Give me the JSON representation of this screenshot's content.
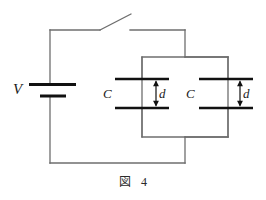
{
  "figure": {
    "caption_label": "図",
    "caption_number": "4",
    "kind": "circuit-diagram"
  },
  "circuit": {
    "source": {
      "name": "battery",
      "label": "V",
      "symbol": "battery-cell"
    },
    "switch": {
      "name": "switch",
      "state": "open",
      "label": ""
    },
    "capacitors": [
      {
        "name": "capacitor-1",
        "label": "C",
        "gap_label": "d",
        "gap_arrow": "double-headed-vertical"
      },
      {
        "name": "capacitor-2",
        "label": "C",
        "gap_label": "d",
        "gap_arrow": "double-headed-vertical"
      }
    ]
  },
  "colors": {
    "wire": "#6e6e6e",
    "plate": "#111111",
    "battery": "#111111",
    "text": "#1a1a1a",
    "background": "#ffffff"
  },
  "geometry": {
    "outer_left_x": 50,
    "outer_top_y": 30,
    "outer_bottom_y": 163,
    "outer_right_x": 185,
    "switch_gap_left_x": 100,
    "switch_gap_right_x": 130,
    "switch_lever_tip_x": 131,
    "switch_lever_tip_y": 14,
    "branch_top_y": 57,
    "branch_bottom_y": 137,
    "inner_left_x": 142,
    "inner_right_x": 228,
    "plate_top_y": 79,
    "plate_bottom_y": 108,
    "plate_half_width": 27,
    "battery_y": 90
  }
}
